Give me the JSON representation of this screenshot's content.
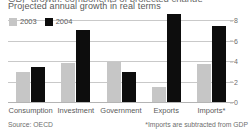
{
  "header": {
    "title_cropped": "GDP growth: components of projected change",
    "subtitle": "Projected annual growth in real terms"
  },
  "legend": {
    "position": "top-left",
    "items": [
      {
        "label": "2003",
        "color": "#c6c6c6",
        "swatch_name": "legend-swatch-2003"
      },
      {
        "label": "2004",
        "color": "#0d0d0d",
        "swatch_name": "legend-swatch-2004"
      }
    ]
  },
  "axis": {
    "y_ticks": [
      "0",
      "2",
      "4",
      "6",
      "8"
    ],
    "y_tick_values": [
      0,
      2,
      4,
      6,
      8
    ]
  },
  "footer": {
    "source": "Source: OECD",
    "note": "*Imports are subtracted from GDP"
  },
  "chart_data": {
    "type": "bar",
    "title": "Projected annual growth in real terms",
    "xlabel": "",
    "ylabel": "",
    "ylim": [
      0,
      8.8
    ],
    "grid": true,
    "legend_position": "top-left",
    "categories": [
      "Consumption",
      "Investment",
      "Government",
      "Exports",
      "Imports*"
    ],
    "series": [
      {
        "name": "2003",
        "color": "#c6c6c6",
        "values": [
          2.9,
          3.8,
          3.9,
          1.5,
          3.7
        ]
      },
      {
        "name": "2004",
        "color": "#0d0d0d",
        "values": [
          3.4,
          7.0,
          2.9,
          8.6,
          7.4
        ]
      }
    ],
    "annotations": [
      "*Imports are subtracted from GDP"
    ],
    "source": "Source: OECD"
  }
}
